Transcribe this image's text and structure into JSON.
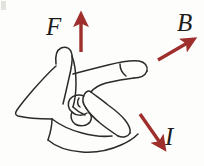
{
  "figure": {
    "background_color": "#fdfdfc",
    "outline_color": "#2b2b2b",
    "arrow_color": "#9e2f2c",
    "label_color": "#1d1d1d"
  },
  "vectors": [
    {
      "id": "force",
      "label": "F",
      "meaning": "force",
      "direction": "up",
      "arrow_color": "#9e2f2c",
      "arrow_from": [
        81,
        52
      ],
      "arrow_to": [
        81,
        18
      ],
      "label_position": [
        46,
        14
      ]
    },
    {
      "id": "magnetic-field",
      "label": "B",
      "meaning": "magnetic field",
      "direction": "up-right",
      "arrow_color": "#9e2f2c",
      "arrow_from": [
        158,
        60
      ],
      "arrow_to": [
        191,
        41
      ],
      "label_position": [
        177,
        10
      ]
    },
    {
      "id": "current",
      "label": "I",
      "meaning": "current",
      "direction": "down-right",
      "arrow_color": "#9e2f2c",
      "arrow_from": [
        140,
        114
      ],
      "arrow_to": [
        163,
        147
      ],
      "label_position": [
        165,
        124
      ]
    }
  ],
  "hand": {
    "parts": [
      {
        "name": "thumb",
        "points_toward": "F"
      },
      {
        "name": "index-finger",
        "points_toward": "B"
      },
      {
        "name": "middle-finger",
        "points_toward": "I"
      },
      {
        "name": "ring-finger",
        "state": "folded"
      },
      {
        "name": "little-finger",
        "state": "folded"
      },
      {
        "name": "palm",
        "state": "visible"
      },
      {
        "name": "wrist",
        "state": "visible"
      }
    ]
  }
}
